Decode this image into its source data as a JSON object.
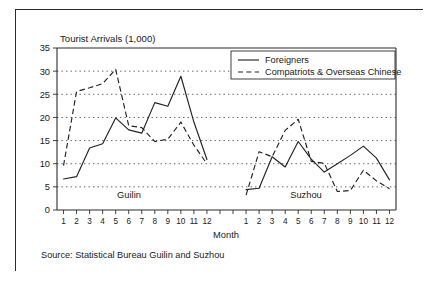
{
  "chart_data": {
    "type": "line",
    "title": "Tourist Arrivals (1,000)",
    "xlabel": "Month",
    "ylabel": "",
    "ylim": [
      0,
      35
    ],
    "ytick_labels": [
      "0",
      "5",
      "10",
      "15",
      "20",
      "25",
      "30",
      "35"
    ],
    "ytick_values": [
      0,
      5,
      10,
      15,
      20,
      25,
      30,
      35
    ],
    "grid": true,
    "legend_position": "top-right",
    "legend": [
      "Foreigners",
      "Compatriots & Overseas Chinese"
    ],
    "panels": [
      {
        "name": "Guilin",
        "categories": [
          "1",
          "2",
          "3",
          "4",
          "5",
          "6",
          "7",
          "8",
          "9",
          "10",
          "11",
          "12"
        ],
        "series": [
          {
            "name": "Foreigners",
            "values": [
              6.7,
              7.2,
              13.4,
              14.3,
              19.9,
              17.3,
              16.6,
              23.2,
              22.4,
              28.9,
              19.0,
              10.9
            ]
          },
          {
            "name": "Compatriots & Overseas Chinese",
            "values": [
              9.6,
              25.6,
              26.4,
              27.3,
              30.4,
              18.2,
              17.8,
              14.8,
              15.3,
              19.0,
              14.0,
              10.0
            ]
          }
        ]
      },
      {
        "name": "Suzhou",
        "categories": [
          "1",
          "2",
          "3",
          "4",
          "5",
          "6",
          "7",
          "8",
          "9",
          "10",
          "11",
          "12"
        ],
        "series": [
          {
            "name": "Foreigners",
            "values": [
              4.4,
              4.7,
              11.5,
              9.3,
              14.8,
              11.0,
              8.2,
              10.0,
              11.8,
              13.8,
              11.2,
              6.5
            ]
          },
          {
            "name": "Compatriots & Overseas Chinese",
            "values": [
              3.2,
              12.6,
              11.5,
              17.2,
              19.6,
              10.5,
              10.1,
              4.0,
              4.2,
              8.6,
              6.3,
              4.6
            ]
          }
        ]
      }
    ],
    "source": "Source: Statistical Bureau Guilin and Suzhou",
    "colors": {
      "line": "#232323",
      "grid": "#3a3a3a",
      "axis": "#2b2b2b",
      "background": "#ffffff"
    }
  },
  "figure": {
    "title": "Tourist Arrivals (1,000)",
    "xlabel": "Month",
    "source": "Source: Statistical Bureau Guilin and Suzhou",
    "panel_guilin": "Guilin",
    "panel_suzhou": "Suzhou",
    "legend_foreigners": "Foreigners",
    "legend_compatriots": "Compatriots & Overseas Chinese"
  }
}
